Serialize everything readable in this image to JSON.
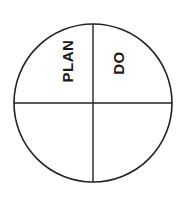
{
  "diagram": {
    "type": "quadrant-circle",
    "stroke_color": "#222222",
    "background_color": "#ffffff",
    "quadrants": [
      {
        "position": "top-left",
        "label": "PLAN"
      },
      {
        "position": "top-right",
        "label": "DO"
      },
      {
        "position": "bottom-left",
        "label": ""
      },
      {
        "position": "bottom-right",
        "label": ""
      }
    ]
  }
}
